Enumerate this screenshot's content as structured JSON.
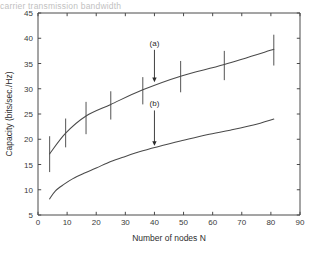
{
  "page": {
    "cut_off_header_text": "carrier transmission bandwidth"
  },
  "chart_data": {
    "type": "line",
    "title": "",
    "subtitle": "",
    "xlabel": "Number of nodes N",
    "ylabel": "Capacity (bits/sec./Hz)",
    "xlim": [
      0,
      90
    ],
    "ylim": [
      5,
      45
    ],
    "xticks": [
      0,
      10,
      20,
      30,
      40,
      50,
      60,
      70,
      80,
      90
    ],
    "yticks": [
      5,
      10,
      15,
      20,
      25,
      30,
      35,
      40,
      45
    ],
    "grid": false,
    "legend_position": "none",
    "series": [
      {
        "name": "(a)",
        "annotation": "(a)",
        "x": [
          4,
          9.5,
          16.5,
          25,
          36,
          49,
          64,
          81
        ],
        "values": [
          17.1,
          21.2,
          24.6,
          26.9,
          29.8,
          32.5,
          34.8,
          37.8
        ],
        "errors_low": [
          13.5,
          18.4,
          21.0,
          23.9,
          26.9,
          29.3,
          31.7,
          34.6
        ],
        "errors_high": [
          20.6,
          24.1,
          27.4,
          29.5,
          32.3,
          35.5,
          37.5,
          40.7
        ],
        "has_error_bars": true
      },
      {
        "name": "(b)",
        "annotation": "(b)",
        "x": [
          4,
          6,
          9,
          12,
          16,
          20,
          25,
          30,
          36,
          43,
          50,
          58,
          66,
          74,
          81
        ],
        "values": [
          8.2,
          9.8,
          11.1,
          12.2,
          13.3,
          14.3,
          15.6,
          16.6,
          17.7,
          18.8,
          19.8,
          20.9,
          21.8,
          22.8,
          24.0
        ],
        "has_error_bars": false
      }
    ],
    "annotations": [
      {
        "label": "(a)",
        "x": 40,
        "y_text": 38.5,
        "y_target": 31.3
      },
      {
        "label": "(b)",
        "x": 40,
        "y_text": 26.5,
        "y_target": 18.7
      }
    ]
  }
}
